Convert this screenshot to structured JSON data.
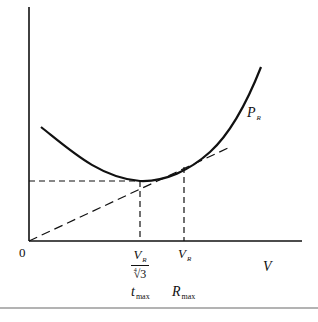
{
  "diagram": {
    "type": "line",
    "title": "",
    "origin_label": "0",
    "x_axis_label": "V",
    "curve_label": {
      "main": "P",
      "sub": "R"
    },
    "ticks": [
      {
        "id": "tmax",
        "value_label": {
          "numerator_main": "V",
          "numerator_sub": "R",
          "denominator_root_index": "4",
          "denominator_radicand": "3"
        },
        "point_label": {
          "main": "t",
          "sub": "max"
        }
      },
      {
        "id": "Rmax",
        "value_label": {
          "main": "V",
          "sub": "R"
        },
        "point_label": {
          "main": "R",
          "sub": "max"
        }
      }
    ],
    "elements": [
      "U-shaped power-required curve P_R vs velocity V",
      "horizontal dashed line from y-axis to curve minimum",
      "vertical dashed line at V_R/∜3 (minimum power, t_max)",
      "dashed tangent line from origin touching curve at V_R (R_max)",
      "vertical dashed line at V_R"
    ],
    "colors": {
      "stroke": "#111111",
      "background": "#ffffff",
      "rule": "#9a9a9a"
    }
  }
}
